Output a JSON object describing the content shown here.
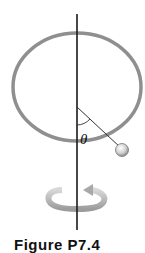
{
  "figure": {
    "angle_label": "θ",
    "caption": "Figure P7.4",
    "colors": {
      "ring": "#8f8f8f",
      "rod": "#1a1a1a",
      "bead": "#cfcfcf",
      "arrow": "#b0b0b0"
    },
    "elements": [
      "vertical rotation axis",
      "circular hoop",
      "bead on hoop",
      "angle theta from vertical",
      "rotation arrow"
    ]
  }
}
